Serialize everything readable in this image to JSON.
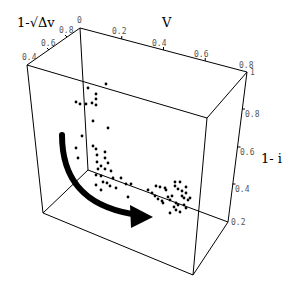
{
  "chart_data": {
    "type": "scatter3d",
    "title": "",
    "axes": {
      "x": {
        "label": "V",
        "ticks": [
          "0",
          "0.2",
          "0.4",
          "0.6",
          "0.8"
        ],
        "range": [
          0,
          0.8
        ]
      },
      "y": {
        "label": "1-√Δv",
        "ticks": [
          "0.4",
          "0.6",
          "0.8"
        ],
        "range": [
          0.4,
          0.8
        ]
      },
      "z": {
        "label": "1- i",
        "ticks": [
          "0.2",
          "0.4",
          "0.6",
          "0.8",
          "1"
        ],
        "range": [
          0.2,
          1
        ]
      }
    },
    "annotation": "curved black arrow indicating trajectory from upper-left cluster down and to the right along the bottom",
    "grid": false,
    "legend": null,
    "points_screen": [
      [
        106,
        84
      ],
      [
        88,
        88
      ],
      [
        96,
        94
      ],
      [
        96,
        99
      ],
      [
        92,
        103
      ],
      [
        86,
        104
      ],
      [
        96,
        105
      ],
      [
        76,
        102
      ],
      [
        80,
        104
      ],
      [
        93,
        121
      ],
      [
        108,
        128
      ],
      [
        82,
        136
      ],
      [
        93,
        146
      ],
      [
        76,
        148
      ],
      [
        78,
        158
      ],
      [
        96,
        149
      ],
      [
        105,
        152
      ],
      [
        105,
        158
      ],
      [
        108,
        163
      ],
      [
        97,
        155
      ],
      [
        97,
        162
      ],
      [
        101,
        166
      ],
      [
        98,
        169
      ],
      [
        105,
        169
      ],
      [
        111,
        171
      ],
      [
        96,
        175
      ],
      [
        101,
        176
      ],
      [
        103,
        182
      ],
      [
        113,
        178
      ],
      [
        107,
        183
      ],
      [
        116,
        188
      ],
      [
        121,
        178
      ],
      [
        126,
        184
      ],
      [
        131,
        184
      ],
      [
        110,
        186
      ],
      [
        101,
        190
      ],
      [
        96,
        185
      ],
      [
        128,
        197
      ],
      [
        148,
        190
      ],
      [
        152,
        193
      ],
      [
        155,
        196
      ],
      [
        158,
        199
      ],
      [
        162,
        201
      ],
      [
        166,
        190
      ],
      [
        170,
        200
      ],
      [
        176,
        203
      ],
      [
        156,
        186
      ],
      [
        160,
        187
      ],
      [
        165,
        188
      ],
      [
        172,
        196
      ],
      [
        175,
        186
      ],
      [
        178,
        189
      ],
      [
        182,
        191
      ],
      [
        186,
        193
      ],
      [
        190,
        198
      ],
      [
        178,
        205
      ],
      [
        184,
        205
      ],
      [
        176,
        210
      ],
      [
        180,
        212
      ],
      [
        186,
        208
      ],
      [
        170,
        213
      ],
      [
        174,
        207
      ],
      [
        163,
        203
      ],
      [
        168,
        197
      ],
      [
        188,
        200
      ],
      [
        184,
        198
      ],
      [
        182,
        196
      ],
      [
        186,
        187
      ],
      [
        180,
        182
      ],
      [
        175,
        182
      ]
    ]
  },
  "labels": {
    "x_title": "V",
    "y_title": "1-√Δv",
    "z_title": "1- i",
    "x_ticks": [
      "0",
      "0.2",
      "0.4",
      "0.6",
      "0.8"
    ],
    "y_ticks": [
      "0.8",
      "0.6",
      "0.4"
    ],
    "z_ticks": [
      "1",
      "0.8",
      "0.6",
      "0.4",
      "0.2"
    ]
  }
}
